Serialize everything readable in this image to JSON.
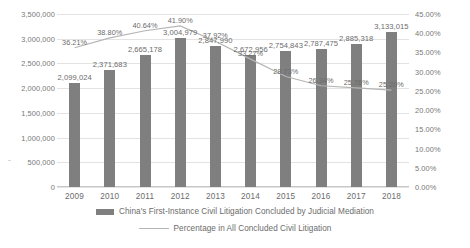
{
  "chart_data": {
    "type": "bar",
    "title": "",
    "xlabel": "",
    "ylabel": "",
    "grid": true,
    "legend_position": "bottom",
    "categories": [
      "2009",
      "2010",
      "2011",
      "2012",
      "2013",
      "2014",
      "2015",
      "2016",
      "2017",
      "2018"
    ],
    "y_left": {
      "label": "",
      "ylim": [
        0,
        3500000
      ],
      "ticks": [
        "0",
        "500,000",
        "1,000,000",
        "1,500,000",
        "2,000,000",
        "2,500,000",
        "3,000,000",
        "3,500,000"
      ],
      "tick_values": [
        0,
        500000,
        1000000,
        1500000,
        2000000,
        2500000,
        3000000,
        3500000
      ]
    },
    "y_right": {
      "label": "",
      "ylim": [
        0,
        45
      ],
      "ticks": [
        "0.00%",
        "5.00%",
        "10.00%",
        "15.00%",
        "20.00%",
        "25.00%",
        "30.00%",
        "35.00%",
        "40.00%",
        "45.00%"
      ],
      "tick_values": [
        0,
        5,
        10,
        15,
        20,
        25,
        30,
        35,
        40,
        45
      ]
    },
    "series": [
      {
        "name": "China's First-Instance Civil Litigation Concluded by Judicial Mediation",
        "type": "bar",
        "axis": "left",
        "color": "#7f7f7f",
        "values": [
          2099024,
          2371683,
          2665178,
          3004979,
          2847990,
          2672956,
          2754843,
          2787475,
          2885318,
          3133015
        ],
        "data_labels": [
          "2,099,024",
          "2,371,683",
          "2,665,178",
          "3,004,979",
          "2,847,990",
          "2,672,956",
          "2,754,843",
          "2,787,475",
          "2,885,318",
          "3,133,015"
        ]
      },
      {
        "name": "Percentage in All Concluded Civil Litigation",
        "type": "line",
        "axis": "right",
        "color": "#b5b5b5",
        "values": [
          36.21,
          38.8,
          40.64,
          41.9,
          37.92,
          33.27,
          28.73,
          26.34,
          25.76,
          25.2
        ],
        "data_labels": [
          "36.21%",
          "38.80%",
          "40.64%",
          "41.90%",
          "37.92%",
          "33.27%",
          "28.73%",
          "26.34%",
          "25.76%",
          "25.20%"
        ]
      }
    ]
  }
}
